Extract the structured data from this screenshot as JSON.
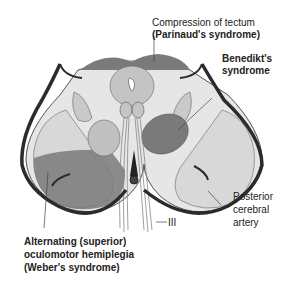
{
  "diagram": {
    "labels": {
      "tectum_line1": "Compression of tectum",
      "tectum_line2": "(Parinaud's syndrome)",
      "benedikt_line1": "Benedikt's",
      "benedikt_line2": "syndrome",
      "pca_line1": "Posterior",
      "pca_line2": "cerebral",
      "pca_line3": "artery",
      "cn3": "III",
      "weber_line1": "Alternating (superior)",
      "weber_line2": "oculomotor hemiplegia",
      "weber_line3": "(Weber's syndrome)"
    },
    "colors": {
      "lesion": "#7a7a7a",
      "tissue_light": "#e6e6e6",
      "tissue_mid": "#cfcfcf",
      "nucleus": "#b9b9b9",
      "artery": "#2b2b2b",
      "outline": "#555555"
    }
  }
}
